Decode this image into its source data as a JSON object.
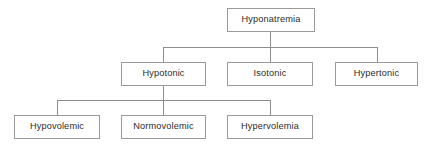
{
  "diagram": {
    "type": "hierarchy-flowchart",
    "background_color": "#ffffff",
    "box_fill_color": "#ffffff",
    "box_border_color": "#9a9a9a",
    "text_color": "#2b2b2b",
    "connector_color": "#8d8d8d",
    "levels": [
      {
        "level": 1,
        "nodes": [
          {
            "id": "hyponatremia",
            "label": "Hyponatremia",
            "x": 227,
            "y": 8,
            "w": 88,
            "h": 24
          }
        ]
      },
      {
        "level": 2,
        "nodes": [
          {
            "id": "hypotonic",
            "label": "Hypotonic",
            "x": 121,
            "y": 62,
            "w": 85,
            "h": 24
          },
          {
            "id": "isotonic",
            "label": "Isotonic",
            "x": 227,
            "y": 62,
            "w": 86,
            "h": 24
          },
          {
            "id": "hypertonic",
            "label": "Hypertonic",
            "x": 335,
            "y": 62,
            "w": 83,
            "h": 24
          }
        ]
      },
      {
        "level": 3,
        "nodes": [
          {
            "id": "hypovolemic",
            "label": "Hypovolemic",
            "x": 14,
            "y": 115,
            "w": 86,
            "h": 24
          },
          {
            "id": "normovolemic",
            "label": "Normovolemic",
            "x": 121,
            "y": 115,
            "w": 85,
            "h": 24
          },
          {
            "id": "hypervolemia",
            "label": "Hypervolemia",
            "x": 227,
            "y": 115,
            "w": 86,
            "h": 24
          }
        ]
      }
    ],
    "connections": [
      {
        "from": "hyponatremia",
        "to": "hypotonic"
      },
      {
        "from": "hyponatremia",
        "to": "isotonic"
      },
      {
        "from": "hyponatremia",
        "to": "hypertonic"
      },
      {
        "from": "hypotonic",
        "to": "hypovolemic"
      },
      {
        "from": "hypotonic",
        "to": "normovolemic"
      },
      {
        "from": "hypotonic",
        "to": "hypervolemia"
      }
    ],
    "edges_geometry": [
      {
        "name": "root-stem-down",
        "orient": "v",
        "x": 270,
        "y": 32,
        "len": 15
      },
      {
        "name": "level2-bus-bar",
        "orient": "h",
        "x": 163,
        "y": 47,
        "len": 215
      },
      {
        "name": "drop-to-hypotonic",
        "orient": "v",
        "x": 163,
        "y": 47,
        "len": 15
      },
      {
        "name": "drop-to-isotonic",
        "orient": "v",
        "x": 270,
        "y": 47,
        "len": 15
      },
      {
        "name": "drop-to-hypertonic",
        "orient": "v",
        "x": 377,
        "y": 47,
        "len": 15
      },
      {
        "name": "hypotonic-stem-down",
        "orient": "v",
        "x": 163,
        "y": 86,
        "len": 15
      },
      {
        "name": "level3-bus-bar",
        "orient": "h",
        "x": 57,
        "y": 100,
        "len": 214
      },
      {
        "name": "drop-to-hypovolemic",
        "orient": "v",
        "x": 57,
        "y": 100,
        "len": 15
      },
      {
        "name": "drop-to-normovolemic",
        "orient": "v",
        "x": 163,
        "y": 100,
        "len": 15
      },
      {
        "name": "drop-to-hypervolemia",
        "orient": "v",
        "x": 270,
        "y": 100,
        "len": 15
      }
    ]
  }
}
